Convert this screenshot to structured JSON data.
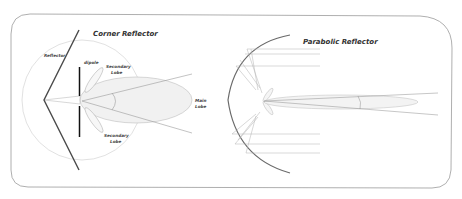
{
  "diagram": {
    "colors": {
      "frame": "#9a9a9a",
      "reflector": "#4a4a4a",
      "dipole": "#111111",
      "thin_line": "#a8a8a8",
      "lobe_fill": "#f1f1f1",
      "circle": "#c8c8c8"
    },
    "corner_reflector": {
      "title": "Corner Reflector",
      "labels": {
        "reflector": "Reflector",
        "dipole": "dipole",
        "secondary_lobe_top_1": "Secondary",
        "secondary_lobe_top_2": "Lobe",
        "secondary_lobe_bottom_1": "Secondary",
        "secondary_lobe_bottom_2": "Lobe",
        "main_lobe_1": "Main",
        "main_lobe_2": "Lobe"
      }
    },
    "parabolic_reflector": {
      "title": "Parabolic Reflector"
    }
  }
}
